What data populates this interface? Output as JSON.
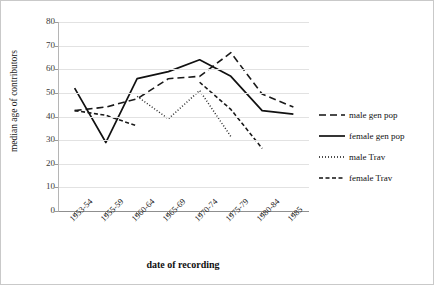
{
  "chart_data": {
    "type": "line",
    "title": "",
    "xlabel": "date of recording",
    "ylabel": "median age of contributors",
    "categories": [
      "1953-54",
      "1955-59",
      "1960-64",
      "1965-69",
      "1970-74",
      "1975-79",
      "1980-84",
      "1985"
    ],
    "ylim": [
      0,
      80
    ],
    "yticks": [
      0,
      10,
      20,
      30,
      40,
      50,
      60,
      70,
      80
    ],
    "grid": true,
    "legend_position": "right",
    "series": [
      {
        "name": "male gen pop",
        "style": "long-dash",
        "color": "#1a1a1a",
        "x": [
          "1953-54",
          "1955-59",
          "1960-64",
          "1965-69",
          "1970-74",
          "1975-79",
          "1980-84",
          "1985"
        ],
        "values": [
          42.5,
          44.0,
          47.5,
          56.0,
          57.0,
          67.0,
          49.5,
          44.0
        ]
      },
      {
        "name": "female gen pop",
        "style": "solid",
        "color": "#111111",
        "x": [
          "1953-54",
          "1955-59",
          "1960-64",
          "1965-69",
          "1970-74",
          "1975-79",
          "1980-84",
          "1985"
        ],
        "values": [
          52.0,
          29.0,
          56.0,
          59.0,
          64.0,
          57.0,
          42.5,
          41.0
        ]
      },
      {
        "name": "male Trav",
        "style": "dotted",
        "color": "#2a2a2a",
        "x": [
          "1960-64",
          "1965-69",
          "1970-74",
          "1975-79"
        ],
        "values": [
          48.5,
          39.0,
          51.0,
          31.5
        ]
      },
      {
        "name": "female Trav",
        "style": "short-dash",
        "color": "#1a1a1a",
        "x": [
          "1953-54",
          "1955-59",
          "1960-64"
        ],
        "values": [
          42.5,
          40.5,
          36.0
        ]
      },
      {
        "name": "female Trav segment 2",
        "style": "short-dash",
        "color": "#1a1a1a",
        "x": [
          "1970-74",
          "1975-79",
          "1980-84"
        ],
        "values": [
          54.5,
          43.0,
          26.5
        ]
      }
    ]
  },
  "axes": {
    "y_title": "median age of contributors",
    "x_title": "date of recording",
    "y_tick_labels": [
      "80",
      "70",
      "60",
      "50",
      "40",
      "30",
      "20",
      "10",
      "0"
    ],
    "x_tick_labels": [
      "1953-54",
      "1955-59",
      "1960-64",
      "1965-69",
      "1970-74",
      "1975-79",
      "1980-84",
      "1985"
    ]
  },
  "legend": {
    "items": [
      {
        "label": "male gen pop",
        "style": "long-dash"
      },
      {
        "label": "female gen pop",
        "style": "solid"
      },
      {
        "label": "male Trav",
        "style": "dotted"
      },
      {
        "label": "female Trav",
        "style": "short-dash"
      }
    ]
  }
}
